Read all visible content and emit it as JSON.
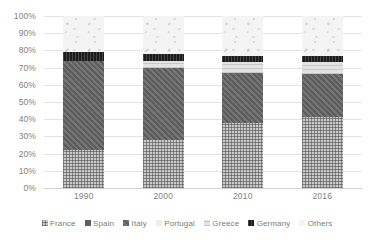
{
  "chart_data": {
    "type": "bar",
    "subtype": "stacked-100-percent",
    "title": "",
    "subtitle": "",
    "xlabel": "",
    "ylabel": "",
    "categories": [
      "1990",
      "2000",
      "2010",
      "2016"
    ],
    "ylim": [
      0,
      100
    ],
    "y_ticks": [
      "0%",
      "10%",
      "20%",
      "30%",
      "40%",
      "50%",
      "60%",
      "70%",
      "80%",
      "90%",
      "100%"
    ],
    "y_tick_values": [
      0,
      10,
      20,
      30,
      40,
      50,
      60,
      70,
      80,
      90,
      100
    ],
    "grid": true,
    "legend_position": "bottom",
    "stack_order_bottom_to_top": [
      "France",
      "Spain",
      "Italy",
      "Portugal",
      "Greece",
      "Germany",
      "Others"
    ],
    "series": [
      {
        "name": "France",
        "color": "#c9c9c9",
        "values": [
          22,
          28,
          38,
          41
        ]
      },
      {
        "name": "Spain",
        "color": "#5f5f5f",
        "values": [
          0,
          0,
          0,
          0
        ]
      },
      {
        "name": "Italy",
        "color": "#6e6e6e",
        "values": [
          52,
          42,
          29,
          25
        ]
      },
      {
        "name": "Portugal",
        "color": "#ededed",
        "values": [
          0,
          0,
          0,
          0
        ]
      },
      {
        "name": "Greece",
        "color": "#e3e3e3",
        "values": [
          0,
          4,
          6,
          7
        ]
      },
      {
        "name": "Germany",
        "color": "#1c1c1c",
        "values": [
          5,
          4,
          4,
          4
        ]
      },
      {
        "name": "Others",
        "color": "#f4f4f4",
        "values": [
          21,
          22,
          23,
          23
        ]
      }
    ]
  },
  "legend": {
    "items": [
      {
        "label": "France"
      },
      {
        "label": "Spain"
      },
      {
        "label": "Italy"
      },
      {
        "label": "Portugal"
      },
      {
        "label": "Greece"
      },
      {
        "label": "Germany"
      },
      {
        "label": "Others"
      }
    ]
  }
}
